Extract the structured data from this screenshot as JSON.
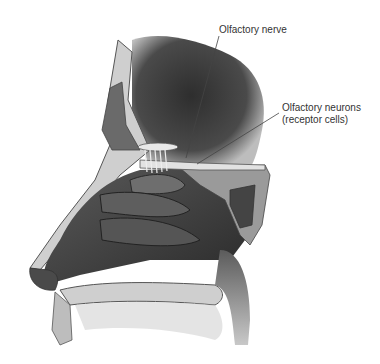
{
  "figure": {
    "labels": [
      {
        "id": "olfactory-nerve",
        "text": "Olfactory nerve"
      },
      {
        "id": "olfactory-neurons",
        "line1": "Olfactory neurons",
        "line2": "(receptor cells)"
      }
    ],
    "colors": {
      "background": "#ffffff",
      "cavity_dark": "#3a3a3a",
      "tissue_mid": "#6b6b6b",
      "bone_light": "#d6d6d6",
      "label_text": "#333333",
      "leader_line": "#444444"
    }
  }
}
